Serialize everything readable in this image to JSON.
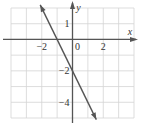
{
  "chart_data": {
    "type": "line",
    "title": "",
    "xlabel": "x",
    "ylabel": "y",
    "xlim": [
      -4,
      4
    ],
    "ylim": [
      -5,
      2
    ],
    "grid": true,
    "grid_step": 1,
    "x_tick_labels": [
      {
        "value": -2,
        "label": "−2"
      },
      {
        "value": 0,
        "label": "0"
      },
      {
        "value": 2,
        "label": "2"
      }
    ],
    "y_tick_labels": [
      {
        "value": 1,
        "label": "1"
      },
      {
        "value": -2,
        "label": "−2"
      },
      {
        "value": -4,
        "label": "−4"
      }
    ],
    "series": [
      {
        "name": "y = -2x - 2",
        "equation": "y = -2x - 2",
        "slope": -2,
        "intercept": -2,
        "x": [
          -2.1,
          1.55
        ],
        "y": [
          2.2,
          -5.1
        ],
        "arrows": "both"
      }
    ],
    "x_intercept": -1,
    "y_intercept": -2
  },
  "colors": {
    "grid": "#d4d4d4",
    "axis": "#555555",
    "line": "#555555",
    "text": "#333333"
  }
}
